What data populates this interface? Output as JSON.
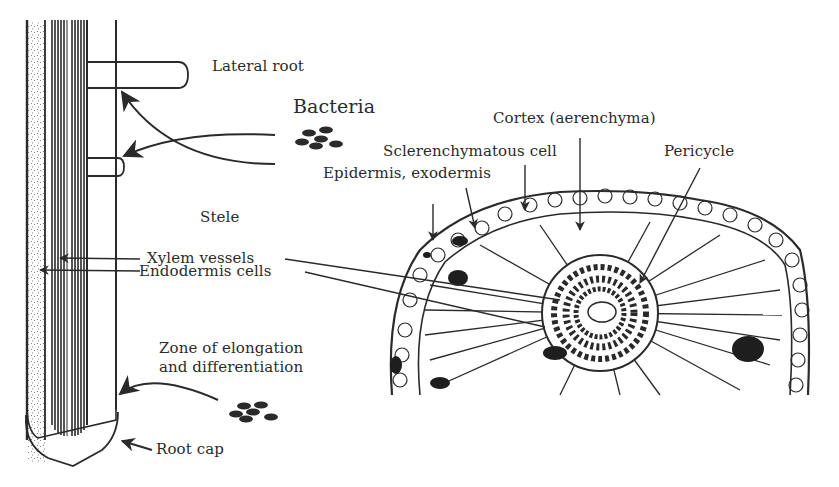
{
  "figure": {
    "left_panel": "Longitudinal section of root tip",
    "right_panel": "Transverse section of root"
  },
  "labels": {
    "lateral_root": "Lateral root",
    "bacteria": "Bacteria",
    "cortex": "Cortex (aerenchyma)",
    "sclerenchymatous_cell": "Sclerenchymatous cell",
    "pericycle": "Pericycle",
    "epidermis": "Epidermis, exodermis",
    "stele": "Stele",
    "xylem_vessels": "Xylem vessels",
    "endodermis_cells": "Endodermis cells",
    "zone_line1": "Zone of elongation",
    "zone_line2": "and differentiation",
    "root_cap": "Root cap"
  },
  "icons": {
    "bacteria_cluster_top": "bacteria-cluster",
    "bacteria_cluster_bottom": "bacteria-cluster"
  },
  "colors": {
    "ink": "#2a2a2a",
    "background": "#ffffff",
    "dark_cell": "#1e1e1e"
  }
}
